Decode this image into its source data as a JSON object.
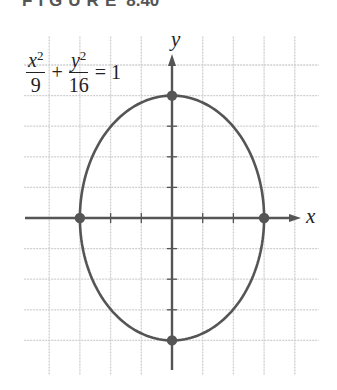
{
  "figure": {
    "title_word": "FIGURE",
    "title_number": "8.40"
  },
  "equation": {
    "term1_numerator_var": "x",
    "term1_numerator_exp": "2",
    "term1_denominator": "9",
    "plus": "+",
    "term2_numerator_var": "y",
    "term2_numerator_exp": "2",
    "term2_denominator": "16",
    "equals": "= 1"
  },
  "axes": {
    "x_label": "x",
    "y_label": "y"
  },
  "colors": {
    "curve": "#555555",
    "axis": "#555555",
    "grid": "#cfcfcf",
    "text": "#222222"
  },
  "chart_data": {
    "type": "line",
    "equation": "x^2/9 + y^2/16 = 1",
    "curve": "ellipse",
    "center": [
      0,
      0
    ],
    "semi_axis_x": 3,
    "semi_axis_y": 4,
    "marked_points": [
      [
        0,
        4
      ],
      [
        0,
        -4
      ],
      [
        -3,
        0
      ],
      [
        3,
        0
      ]
    ],
    "xlabel": "x",
    "ylabel": "y",
    "xlim": [
      -5,
      4.4
    ],
    "ylim": [
      -5,
      5.3
    ],
    "grid": true,
    "tick_spacing": 1
  }
}
